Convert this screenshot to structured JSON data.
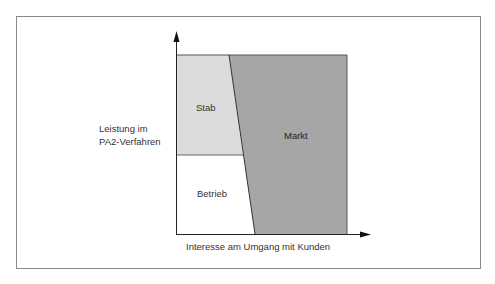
{
  "diagram": {
    "y_axis_label": [
      "Leistung im",
      "PA2-Verfahren"
    ],
    "x_axis_label": "Interesse am Umgang mit Kunden",
    "regions": [
      {
        "name": "Stab",
        "fill": "#dcdcdc"
      },
      {
        "name": "Betrieb",
        "fill": "#ffffff"
      },
      {
        "name": "Markt",
        "fill": "#a6a6a6"
      }
    ],
    "colors": {
      "frame_border": "#8a8a8a",
      "axis": "#222222",
      "region_border": "#555555",
      "text": "#333333"
    }
  }
}
